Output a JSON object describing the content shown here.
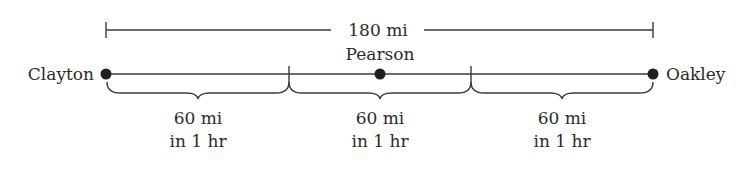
{
  "diagram": {
    "total_distance_label": "180 mi",
    "cities": {
      "start": "Clayton",
      "middle": "Pearson",
      "end": "Oakley"
    },
    "segments": [
      {
        "distance": "60 mi",
        "time": "in 1 hr"
      },
      {
        "distance": "60 mi",
        "time": "in 1 hr"
      },
      {
        "distance": "60 mi",
        "time": "in 1 hr"
      }
    ],
    "colors": {
      "ink": "#2b2b2b",
      "background": "#ffffff"
    }
  }
}
